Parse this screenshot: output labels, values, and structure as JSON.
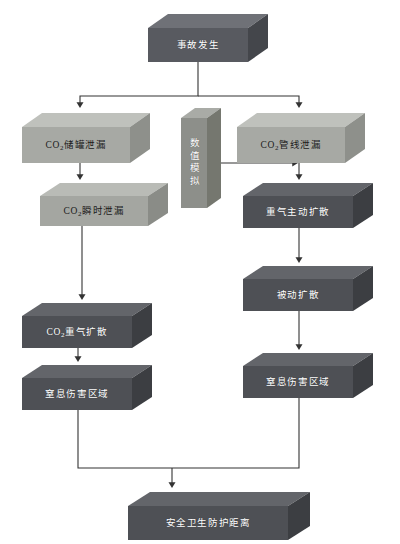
{
  "diagram": {
    "title_text": "",
    "background_color": "#ffffff",
    "nodes": [
      {
        "id": "accident",
        "label": "事故发生",
        "label_html": "事故发生",
        "x": 148,
        "y": 14,
        "w": 100,
        "h": 34,
        "depth_x": 20,
        "depth_y": 14,
        "front_color": "#585a60",
        "top_color": "#6f7177",
        "side_color": "#44464b",
        "text_color": "#ffffff",
        "style": "dark",
        "orientation": "horizontal"
      },
      {
        "id": "tank-leak",
        "label": "CO2储罐泄漏",
        "label_html": "CO<sub>2</sub>储罐泄漏",
        "x": 22,
        "y": 113,
        "w": 108,
        "h": 36,
        "depth_x": 20,
        "depth_y": 14,
        "front_color": "#a7a9a4",
        "top_color": "#bfc1bc",
        "side_color": "#8e908b",
        "text_color": "#1b1b1b",
        "style": "light",
        "orientation": "horizontal"
      },
      {
        "id": "pipeline-leak",
        "label": "CO2管线泄漏",
        "label_html": "CO<sub>2</sub>管线泄漏",
        "x": 237,
        "y": 113,
        "w": 108,
        "h": 36,
        "depth_x": 20,
        "depth_y": 14,
        "front_color": "#a7a9a4",
        "top_color": "#bfc1bc",
        "side_color": "#8e908b",
        "text_color": "#1b1b1b",
        "style": "light",
        "orientation": "horizontal"
      },
      {
        "id": "numerical-simulation",
        "label": "数值模拟",
        "label_html": "数值模拟",
        "x": 181,
        "y": 108,
        "w": 26,
        "h": 90,
        "depth_x": 14,
        "depth_y": 10,
        "front_color": "#8d8f8a",
        "top_color": "#a9aba6",
        "side_color": "#75776f",
        "text_color": "#ffffff",
        "style": "mid",
        "orientation": "vertical"
      },
      {
        "id": "instant-leak",
        "label": "CO2瞬时泄漏",
        "label_html": "CO<sub>2</sub>瞬时泄漏",
        "x": 40,
        "y": 183,
        "w": 108,
        "h": 30,
        "depth_x": 20,
        "depth_y": 13,
        "front_color": "#a4a6a1",
        "top_color": "#b9bbb6",
        "side_color": "#8a8c87",
        "text_color": "#1b1b1b",
        "style": "light",
        "orientation": "horizontal"
      },
      {
        "id": "heavy-gas-active-diffusion",
        "label": "重气主动扩散",
        "label_html": "重气主动扩散",
        "x": 243,
        "y": 183,
        "w": 110,
        "h": 32,
        "depth_x": 20,
        "depth_y": 13,
        "front_color": "#4e5055",
        "top_color": "#63656a",
        "side_color": "#3c3e42",
        "text_color": "#ffffff",
        "style": "dark",
        "orientation": "horizontal"
      },
      {
        "id": "passive-diffusion",
        "label": "被动扩散",
        "label_html": "被动扩散",
        "x": 243,
        "y": 266,
        "w": 110,
        "h": 32,
        "depth_x": 20,
        "depth_y": 13,
        "front_color": "#4e5055",
        "top_color": "#63656a",
        "side_color": "#3c3e42",
        "text_color": "#ffffff",
        "style": "dark",
        "orientation": "horizontal"
      },
      {
        "id": "co2-heavy-gas-diffusion",
        "label": "CO2重气扩散",
        "label_html": "CO<sub>2</sub>重气扩散",
        "x": 22,
        "y": 303,
        "w": 110,
        "h": 32,
        "depth_x": 20,
        "depth_y": 13,
        "front_color": "#4e5055",
        "top_color": "#63656a",
        "side_color": "#3c3e42",
        "text_color": "#ffffff",
        "style": "dark",
        "orientation": "horizontal"
      },
      {
        "id": "asphyxiation-area-left",
        "label": "窒息伤害区域",
        "label_html": "窒息伤害区域",
        "x": 22,
        "y": 365,
        "w": 110,
        "h": 32,
        "depth_x": 20,
        "depth_y": 13,
        "front_color": "#4e5055",
        "top_color": "#63656a",
        "side_color": "#3c3e42",
        "text_color": "#ffffff",
        "style": "dark",
        "orientation": "horizontal"
      },
      {
        "id": "asphyxiation-area-right",
        "label": "窒息伤害区域",
        "label_html": "窒息伤害区域",
        "x": 243,
        "y": 353,
        "w": 110,
        "h": 32,
        "depth_x": 20,
        "depth_y": 13,
        "front_color": "#4e5055",
        "top_color": "#63656a",
        "side_color": "#3c3e42",
        "text_color": "#ffffff",
        "style": "dark",
        "orientation": "horizontal"
      },
      {
        "id": "safety-protection-distance",
        "label": "安全卫生防护距离",
        "label_html": "安全卫生防护距离",
        "x": 128,
        "y": 492,
        "w": 160,
        "h": 34,
        "depth_x": 22,
        "depth_y": 14,
        "front_color": "#4e5055",
        "top_color": "#63656a",
        "side_color": "#3c3e42",
        "text_color": "#ffffff",
        "style": "dark",
        "orientation": "horizontal"
      }
    ],
    "edges": [
      {
        "id": "edge-accident-split",
        "from": "accident",
        "to": "tank-leak,pipeline-leak",
        "kind": "split-down"
      },
      {
        "id": "edge-tank-to-instant",
        "from": "tank-leak",
        "to": "instant-leak",
        "kind": "straight-down"
      },
      {
        "id": "edge-pipeline-to-active",
        "from": "pipeline-leak",
        "to": "heavy-gas-active-diffusion",
        "kind": "straight-down"
      },
      {
        "id": "edge-simulation-to-pipeline-branch",
        "from": "numerical-simulation",
        "to": "pipeline-leak",
        "kind": "straight-right"
      },
      {
        "id": "edge-instant-to-heavy",
        "from": "instant-leak",
        "to": "co2-heavy-gas-diffusion",
        "kind": "straight-down"
      },
      {
        "id": "edge-active-to-passive",
        "from": "heavy-gas-active-diffusion",
        "to": "passive-diffusion",
        "kind": "straight-down"
      },
      {
        "id": "edge-heavy-to-asphyx-left",
        "from": "co2-heavy-gas-diffusion",
        "to": "asphyxiation-area-left",
        "kind": "straight-down"
      },
      {
        "id": "edge-passive-to-asphyx-right",
        "from": "passive-diffusion",
        "to": "asphyxiation-area-right",
        "kind": "straight-down"
      },
      {
        "id": "edge-merge-to-distance",
        "from": "asphyxiation-area-left,asphyxiation-area-right",
        "to": "safety-protection-distance",
        "kind": "merge-down"
      }
    ],
    "edge_color": "#3a3a3a"
  }
}
